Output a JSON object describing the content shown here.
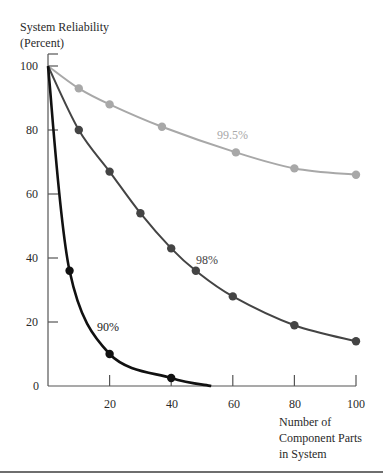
{
  "chart_data": {
    "type": "line",
    "title": "",
    "ylabel": "System Reliability (Percent)",
    "ylabel_lines": [
      "System Reliability",
      "(Percent)"
    ],
    "xlabel": "Number of Component Parts in System",
    "xlabel_lines": [
      "Number of",
      "Component Parts",
      "in System"
    ],
    "xlim": [
      0,
      100
    ],
    "ylim": [
      0,
      100
    ],
    "x_ticks": [
      20,
      40,
      60,
      80,
      100
    ],
    "y_ticks": [
      0,
      20,
      40,
      60,
      80,
      100
    ],
    "grid": false,
    "legend": "inline labels",
    "series": [
      {
        "name": "99.5%",
        "color": "#a8a8a8",
        "markers_x": [
          0,
          10,
          20,
          37,
          61,
          80,
          100
        ],
        "markers_y": [
          100,
          93,
          88,
          81,
          73,
          68,
          66
        ],
        "label_pos": {
          "x": 217,
          "y": 128
        }
      },
      {
        "name": "98%",
        "color": "#444444",
        "markers_x": [
          0,
          10,
          20,
          30,
          40,
          48,
          60,
          80,
          100
        ],
        "markers_y": [
          100,
          80,
          67,
          54,
          43,
          36,
          28,
          19,
          14
        ],
        "label_pos": {
          "x": 196,
          "y": 253
        }
      },
      {
        "name": "90%",
        "color": "#111111",
        "markers_x": [
          0,
          7,
          20,
          40
        ],
        "markers_y": [
          100,
          36,
          10,
          2.5
        ],
        "curve_end_x": 53,
        "label_pos": {
          "x": 97,
          "y": 320
        }
      }
    ]
  }
}
